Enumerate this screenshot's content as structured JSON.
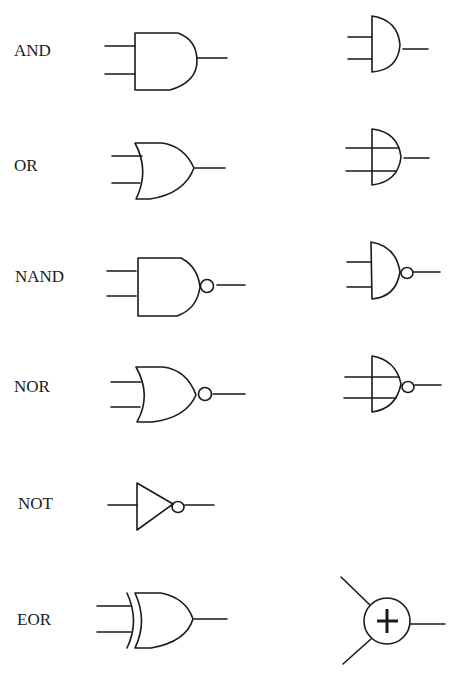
{
  "diagram": {
    "stroke_color": "#1a1a1a",
    "background": "#ffffff",
    "gates": [
      {
        "id": "and",
        "label": "AND",
        "label_pos": [
          14,
          42
        ],
        "left_symbol": "distinctive-and",
        "right_symbol": "alt-and"
      },
      {
        "id": "or",
        "label": "OR",
        "label_pos": [
          14,
          157
        ],
        "left_symbol": "distinctive-or",
        "right_symbol": "alt-or"
      },
      {
        "id": "nand",
        "label": "NAND",
        "label_pos": [
          15,
          268
        ],
        "left_symbol": "distinctive-nand",
        "right_symbol": "alt-nand"
      },
      {
        "id": "nor",
        "label": "NOR",
        "label_pos": [
          14,
          378
        ],
        "left_symbol": "distinctive-nor",
        "right_symbol": "alt-nor"
      },
      {
        "id": "not",
        "label": "NOT",
        "label_pos": [
          18,
          495
        ],
        "left_symbol": "buffer-inverter",
        "right_symbol": null
      },
      {
        "id": "eor",
        "label": "EOR",
        "label_pos": [
          17,
          611
        ],
        "left_symbol": "distinctive-xor",
        "right_symbol": "circle-plus"
      }
    ],
    "xor_alt_glyph": "+"
  }
}
